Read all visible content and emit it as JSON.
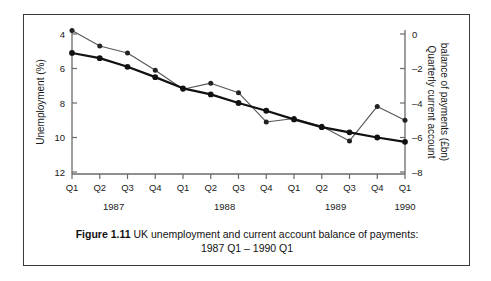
{
  "figure": {
    "caption_label": "Figure 1.11",
    "caption_text": "UK unemployment and current account balance of payments:",
    "caption_subtitle": "1987 Q1 – 1990 Q1"
  },
  "axes": {
    "left_title": "Unemployment (%)",
    "right_title": "Quarterly current account balance of payments (£bn)",
    "left_ticks": [
      "12",
      "10",
      "8",
      "6",
      "4"
    ],
    "right_ticks": [
      "0",
      "–2",
      "–4",
      "–6",
      "–8"
    ],
    "quarter_labels": [
      "Q1",
      "Q2",
      "Q3",
      "Q4",
      "Q1",
      "Q2",
      "Q3",
      "Q4",
      "Q1",
      "Q2",
      "Q3",
      "Q4",
      "Q1"
    ],
    "year_labels": [
      "1987",
      "1988",
      "1989",
      "1990"
    ]
  },
  "chart_data": {
    "type": "line",
    "title": "UK unemployment and current account balance of payments: 1987 Q1 – 1990 Q1",
    "xlabel": "",
    "ylabel": "Unemployment (%)",
    "y2label": "Quarterly current account balance of payments (£bn)",
    "grid": false,
    "legend": "none",
    "categories": [
      "1987 Q1",
      "1987 Q2",
      "1987 Q3",
      "1987 Q4",
      "1988 Q1",
      "1988 Q2",
      "1988 Q3",
      "1988 Q4",
      "1989 Q1",
      "1989 Q2",
      "1989 Q3",
      "1989 Q4",
      "1990 Q1"
    ],
    "ylim": [
      4,
      12.7
    ],
    "y2lim": [
      -8,
      0.7
    ],
    "yticks": [
      4,
      6,
      8,
      10,
      12
    ],
    "y2ticks": [
      0,
      -2,
      -4,
      -6,
      -8
    ],
    "series": [
      {
        "name": "Unemployment (%)",
        "axis": "left",
        "style": "thick-black",
        "values": [
          10.9,
          10.6,
          10.1,
          9.5,
          8.85,
          8.5,
          8.0,
          7.55,
          7.05,
          6.6,
          6.3,
          6.0,
          5.75
        ]
      },
      {
        "name": "Quarterly current account balance of payments (£bn)",
        "axis": "right",
        "style": "thin-grey",
        "values": [
          0.2,
          -0.7,
          -1.1,
          -2.1,
          -3.2,
          -2.85,
          -3.4,
          -5.1,
          -4.9,
          -5.35,
          -6.2,
          -4.2,
          -5.0
        ]
      }
    ]
  }
}
